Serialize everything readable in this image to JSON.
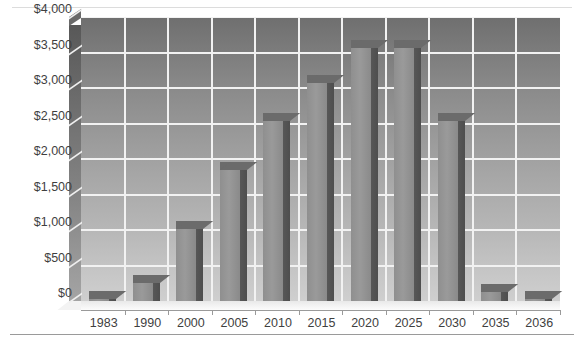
{
  "chart_data": {
    "type": "bar",
    "title": "",
    "subtitle": "",
    "xlabel": "",
    "ylabel": "",
    "categories": [
      "1983",
      "1990",
      "2000",
      "2005",
      "2010",
      "2015",
      "2020",
      "2025",
      "2030",
      "2035",
      "2036"
    ],
    "values": [
      30,
      255,
      1020,
      1850,
      2530,
      3070,
      3570,
      3560,
      2530,
      130,
      25
    ],
    "ylim": [
      0,
      4000
    ],
    "ytick_step": 500,
    "ytick_labels": [
      "$0",
      "$500",
      "$1,000",
      "$1,500",
      "$2,000",
      "$2,500",
      "$3,000",
      "$3,500",
      "$4,000"
    ],
    "ytick_values": [
      0,
      500,
      1000,
      1500,
      2000,
      2500,
      3000,
      3500,
      4000
    ],
    "grid": "horizontal-and-vertical",
    "legend": "none",
    "style": "3d-column-grayscale",
    "colors": {
      "bar_front": "#9a9a9a",
      "bar_side": "#525252",
      "bar_top": "#6b6b6b",
      "gridline": "#f2f2f2",
      "plot_background_top": "#6f6f6f",
      "plot_background_bottom": "#cfcfcf",
      "axis_text": "#3f3f3f",
      "page_background": "#ffffff",
      "rule": "#9a9a9a"
    }
  }
}
